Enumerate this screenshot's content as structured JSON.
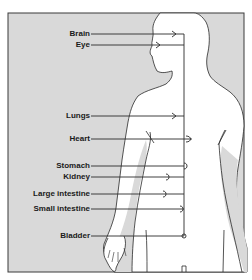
{
  "diagram": {
    "type": "anatomical-body-map",
    "frame_color": "#3a3a3a",
    "background_color": "#d9d9d9",
    "body_fill": "#ffffff",
    "line_color": "#2a2a2a",
    "labels": [
      {
        "id": "brain",
        "text": "Brain",
        "y": 34
      },
      {
        "id": "eye",
        "text": "Eye",
        "y": 45
      },
      {
        "id": "lungs",
        "text": "Lungs",
        "y": 116
      },
      {
        "id": "heart",
        "text": "Heart",
        "y": 139
      },
      {
        "id": "stomach",
        "text": "Stomach",
        "y": 166
      },
      {
        "id": "kidney",
        "text": "Kidney",
        "y": 177
      },
      {
        "id": "large-intestine",
        "text": "Large intestine",
        "y": 194
      },
      {
        "id": "small-intestine",
        "text": "Small intestine",
        "y": 209
      },
      {
        "id": "bladder",
        "text": "Bladder",
        "y": 236
      }
    ]
  }
}
